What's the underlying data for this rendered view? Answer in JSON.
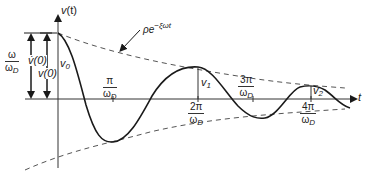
{
  "diagram": {
    "axes": {
      "y_label_var": "v",
      "y_label_arg": "(t)",
      "x_label": "t"
    },
    "envelope": {
      "label_rho": "ρ",
      "label_e": "e",
      "label_exp": "−ξωt"
    },
    "amplitude_labels": {
      "v0": "v",
      "v0_sub": "0",
      "v1": "v",
      "v1_sub": "1",
      "v2": "v",
      "v2_sub": "2"
    },
    "left_dimensions": {
      "outer_frac_num": "ω",
      "outer_frac_den": "ω",
      "outer_frac_den_sub": "D",
      "outer_value": "v̇(0)",
      "inner_value": "v(0)"
    },
    "time_ticks": [
      {
        "num": "π",
        "den": "ω",
        "den_sub": "D"
      },
      {
        "num": "2π",
        "den": "ω",
        "den_sub": "D"
      },
      {
        "num": "3π",
        "den": "ω",
        "den_sub": "D"
      },
      {
        "num": "4π",
        "den": "ω",
        "den_sub": "D"
      }
    ],
    "colors": {
      "curve": "#1a1a1a",
      "axis": "#333333",
      "envelope": "#555555"
    }
  }
}
